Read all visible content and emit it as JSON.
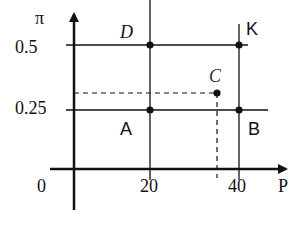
{
  "diagram": {
    "axes": {
      "y_label": "π",
      "x_label": "P",
      "origin_label": "0"
    },
    "y_ticks": [
      {
        "label": "0.5",
        "value": 0.5
      },
      {
        "label": "0.25",
        "value": 0.25
      }
    ],
    "x_ticks": [
      {
        "label": "20",
        "value": 20
      },
      {
        "label": "40",
        "value": 40
      }
    ],
    "points": [
      {
        "label": "D",
        "x": 20,
        "y": 0.5
      },
      {
        "label": "K",
        "x": 40,
        "y": 0.5
      },
      {
        "label": "C",
        "x": 35,
        "y": 0.32
      },
      {
        "label": "A",
        "x": 20,
        "y": 0.25
      },
      {
        "label": "B",
        "x": 40,
        "y": 0.25
      }
    ],
    "colors": {
      "line": "#111111",
      "background": "#ffffff"
    }
  }
}
